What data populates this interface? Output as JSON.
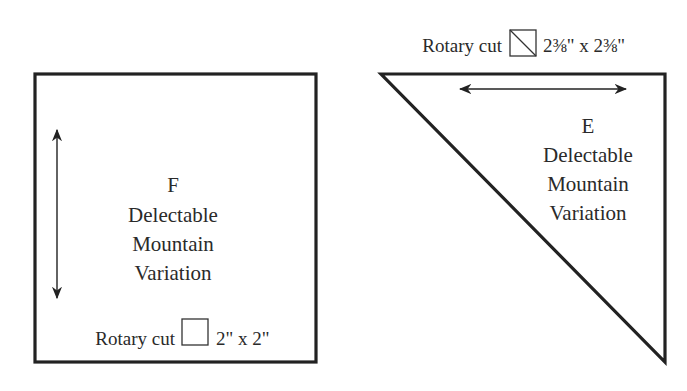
{
  "piece_f": {
    "letter": "F",
    "line1": "Delectable",
    "line2": "Mountain",
    "line3": "Variation",
    "cut_prefix": "Rotary cut",
    "cut_size": "2\" x 2\"",
    "shape": "square",
    "grain": "vertical"
  },
  "piece_e": {
    "letter": "E",
    "line1": "Delectable",
    "line2": "Mountain",
    "line3": "Variation",
    "cut_prefix": "Rotary cut",
    "cut_size": "2⅜\" x 2⅜\"",
    "shape": "half-square-triangle",
    "grain": "horizontal"
  },
  "colors": {
    "stroke": "#222222",
    "text": "#2a2a2a",
    "background": "#ffffff"
  }
}
